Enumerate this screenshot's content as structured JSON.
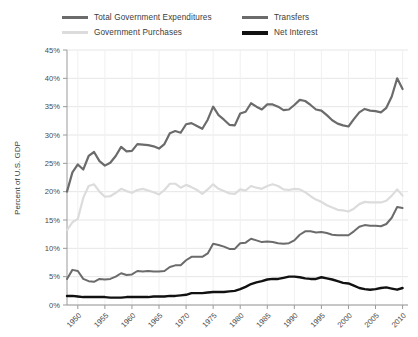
{
  "chart_data": {
    "type": "line",
    "title": "",
    "xlabel": "",
    "ylabel": "Percent of U.S. GDP",
    "xlim": [
      1948,
      2011
    ],
    "ylim": [
      0,
      45
    ],
    "ytick_labels": [
      "0%",
      "5%",
      "10%",
      "15%",
      "20%",
      "25%",
      "30%",
      "35%",
      "40%",
      "45%"
    ],
    "ytick_values": [
      0,
      5,
      10,
      15,
      20,
      25,
      30,
      35,
      40,
      45
    ],
    "xtick_labels": [
      "1950",
      "1955",
      "1960",
      "1965",
      "1970",
      "1975",
      "1980",
      "1985",
      "1990",
      "1995",
      "2000",
      "2005",
      "2010"
    ],
    "xtick_values": [
      1950,
      1955,
      1960,
      1965,
      1970,
      1975,
      1980,
      1985,
      1990,
      1995,
      2000,
      2005,
      2010
    ],
    "grid": true,
    "legend_position": "top",
    "x": [
      1948,
      1949,
      1950,
      1951,
      1952,
      1953,
      1954,
      1955,
      1956,
      1957,
      1958,
      1959,
      1960,
      1961,
      1962,
      1963,
      1964,
      1965,
      1966,
      1967,
      1968,
      1969,
      1970,
      1971,
      1972,
      1973,
      1974,
      1975,
      1976,
      1977,
      1978,
      1979,
      1980,
      1981,
      1982,
      1983,
      1984,
      1985,
      1986,
      1987,
      1988,
      1989,
      1990,
      1991,
      1992,
      1993,
      1994,
      1995,
      1996,
      1997,
      1998,
      1999,
      2000,
      2001,
      2002,
      2003,
      2004,
      2005,
      2006,
      2007,
      2008,
      2009,
      2010
    ],
    "series": [
      {
        "name": "Total Government Expenditures",
        "color": "#6b6b6b",
        "width": 2.2,
        "values": [
          20.0,
          23.4,
          24.8,
          23.9,
          26.3,
          27.0,
          25.4,
          24.6,
          25.1,
          26.3,
          27.9,
          27.1,
          27.2,
          28.4,
          28.3,
          28.2,
          28.0,
          27.6,
          28.4,
          30.3,
          30.7,
          30.4,
          31.9,
          32.1,
          31.6,
          31.1,
          32.7,
          35.0,
          33.5,
          32.7,
          31.8,
          31.7,
          33.8,
          34.1,
          35.6,
          35.0,
          34.5,
          35.4,
          35.4,
          35.0,
          34.4,
          34.5,
          35.3,
          36.2,
          36.0,
          35.3,
          34.5,
          34.3,
          33.5,
          32.6,
          32.0,
          31.7,
          31.5,
          32.8,
          34.0,
          34.6,
          34.3,
          34.2,
          34.0,
          34.8,
          36.8,
          40.0,
          38.1
        ]
      },
      {
        "name": "Government Purchases",
        "color": "#dcdcdc",
        "width": 2.2,
        "values": [
          13.2,
          14.6,
          15.2,
          18.9,
          21.0,
          21.3,
          20.0,
          19.1,
          19.2,
          19.8,
          20.5,
          20.1,
          19.8,
          20.3,
          20.5,
          20.2,
          19.9,
          19.5,
          20.3,
          21.4,
          21.4,
          20.7,
          21.2,
          20.8,
          20.3,
          19.6,
          20.4,
          21.3,
          20.5,
          20.1,
          19.7,
          19.6,
          20.4,
          20.2,
          21.0,
          20.7,
          20.5,
          21.0,
          21.3,
          21.0,
          20.4,
          20.3,
          20.5,
          20.4,
          19.9,
          19.2,
          18.6,
          18.2,
          17.6,
          17.2,
          16.8,
          16.7,
          16.5,
          17.0,
          17.8,
          18.2,
          18.1,
          18.1,
          18.1,
          18.4,
          19.3,
          20.4,
          19.3
        ]
      },
      {
        "name": "Transfers",
        "color": "#6b6b6b",
        "width": 2.0,
        "values": [
          4.6,
          6.2,
          6.0,
          4.6,
          4.2,
          4.1,
          4.6,
          4.5,
          4.6,
          5.0,
          5.6,
          5.3,
          5.4,
          6.0,
          5.9,
          6.0,
          5.9,
          5.9,
          6.0,
          6.7,
          7.0,
          7.0,
          7.9,
          8.5,
          8.5,
          8.5,
          9.1,
          10.8,
          10.6,
          10.3,
          9.9,
          9.9,
          10.9,
          11.0,
          11.7,
          11.4,
          11.1,
          11.2,
          11.1,
          10.9,
          10.8,
          10.9,
          11.4,
          12.4,
          13.0,
          13.0,
          12.8,
          12.9,
          12.7,
          12.4,
          12.3,
          12.3,
          12.3,
          13.0,
          13.8,
          14.1,
          14.0,
          14.0,
          13.9,
          14.3,
          15.4,
          17.3,
          17.1
        ]
      },
      {
        "name": "Net Interest",
        "color": "#111111",
        "width": 2.4,
        "values": [
          1.6,
          1.6,
          1.5,
          1.4,
          1.4,
          1.4,
          1.4,
          1.4,
          1.3,
          1.3,
          1.3,
          1.4,
          1.4,
          1.4,
          1.4,
          1.4,
          1.5,
          1.5,
          1.5,
          1.6,
          1.6,
          1.7,
          1.8,
          2.1,
          2.1,
          2.1,
          2.2,
          2.3,
          2.3,
          2.3,
          2.4,
          2.5,
          2.8,
          3.2,
          3.7,
          4.0,
          4.2,
          4.5,
          4.6,
          4.6,
          4.8,
          5.0,
          5.0,
          4.9,
          4.7,
          4.6,
          4.6,
          4.9,
          4.7,
          4.5,
          4.2,
          3.9,
          3.8,
          3.4,
          3.0,
          2.8,
          2.7,
          2.8,
          3.0,
          3.1,
          2.9,
          2.7,
          3.0
        ]
      }
    ]
  },
  "legend": {
    "items": [
      {
        "label": "Total Government Expenditures",
        "color": "#6b6b6b",
        "thickness": 3
      },
      {
        "label": "Transfers",
        "color": "#6b6b6b",
        "thickness": 3
      },
      {
        "label": "Government Purchases",
        "color": "#dcdcdc",
        "thickness": 3
      },
      {
        "label": "Net Interest",
        "color": "#111111",
        "thickness": 4
      }
    ]
  }
}
